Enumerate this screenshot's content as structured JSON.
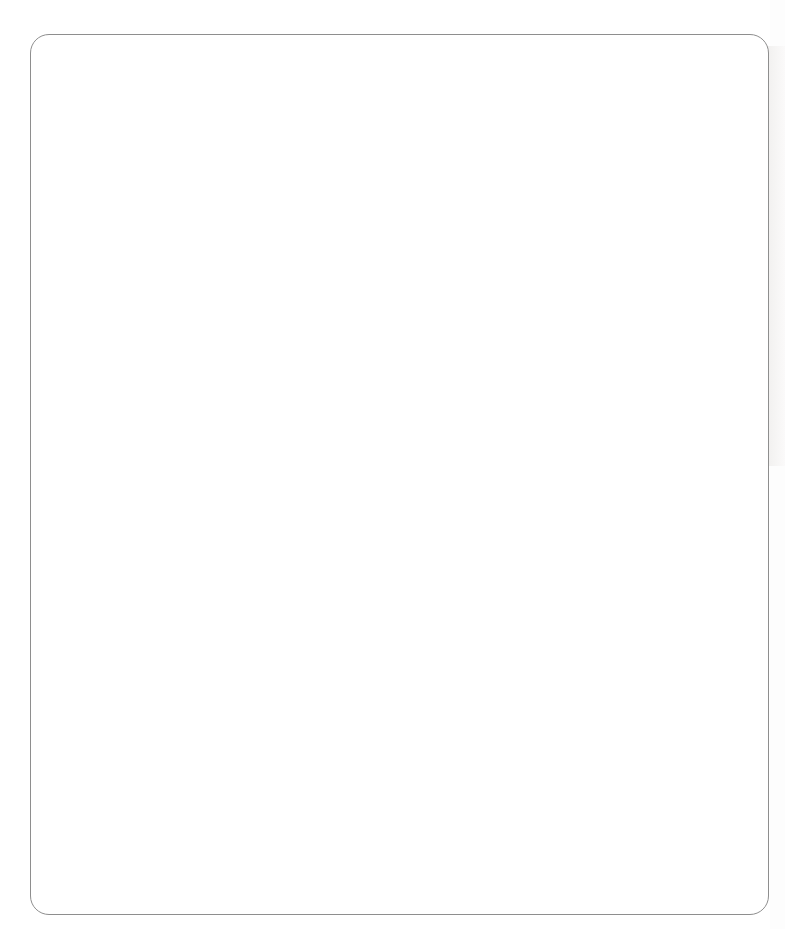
{
  "header": {
    "col_type": "Type of abuse",
    "col_percent": "Percent",
    "col_chart": "Dissociative experiences"
  },
  "groups": [
    {
      "title": "Emotional abuse",
      "rows": [
        {
          "label": "No emotional abuse",
          "percent": "74%"
        },
        {
          "label": "Low",
          "percent": "15%"
        },
        {
          "label": "High",
          "percent": "11%"
        }
      ]
    },
    {
      "title": "Physical abuse",
      "rows": [
        {
          "label": "No physical abuse",
          "percent": "72%"
        },
        {
          "label": "Low abuse",
          "percent": "12%"
        },
        {
          "label": "Moderate abuse",
          "percent": "6%"
        },
        {
          "label": "High abuse",
          "percent": "11%"
        }
      ]
    },
    {
      "title": "Sexual abuse",
      "rows": [
        {
          "label": "No abuse",
          "percent": "93%"
        },
        {
          "label": "Some abuse",
          "percent": "7%"
        }
      ]
    }
  ],
  "axis": {
    "ticks": [
      0,
      0.5,
      1,
      1.5,
      2,
      2.5
    ],
    "tick_labels": [
      "0",
      "0.5",
      "1",
      "1.5",
      "2",
      "2.5"
    ],
    "min": 0,
    "max": 2.5
  },
  "colors": {
    "bar_dark": "#575757",
    "bar_darkest": "#4a4a4a",
    "bar_medium": "#6e6e6e",
    "bar_light": "#8e8e8e",
    "frame": "#1d1d1d",
    "card_border": "#8e8e8e",
    "text": "#242424"
  },
  "chart_data": [
    {
      "type": "bar",
      "orientation": "horizontal",
      "title": "Dissociative experiences",
      "group": "Emotional abuse",
      "categories": [
        "No emotional abuse",
        "Low",
        "High"
      ],
      "values": [
        0.75,
        1.19,
        1.76
      ],
      "bar_colors": [
        "#575757",
        "#6e6e6e",
        "#4a4a4a"
      ],
      "xlabel": "",
      "ylabel": "",
      "xlim": [
        0,
        2.5
      ],
      "xticks": [
        0,
        0.5,
        1,
        1.5,
        2,
        2.5
      ],
      "grid": false,
      "legend": "none"
    },
    {
      "type": "bar",
      "orientation": "horizontal",
      "title": "Dissociative experiences",
      "group": "Physical abuse",
      "categories": [
        "No physical abuse",
        "Low abuse",
        "Moderate abuse",
        "High abuse"
      ],
      "values": [
        0.72,
        1.19,
        1.4,
        1.82
      ],
      "bar_colors": [
        "#575757",
        "#6e6e6e",
        "#4a4a4a",
        "#8e8e8e"
      ],
      "xlabel": "",
      "ylabel": "",
      "xlim": [
        0,
        2.5
      ],
      "xticks": [
        0,
        0.5,
        1,
        1.5,
        2,
        2.5
      ],
      "grid": false,
      "legend": "none"
    },
    {
      "type": "bar",
      "orientation": "horizontal",
      "title": "Dissociative experiences",
      "group": "Sexual abuse",
      "categories": [
        "No abuse",
        "Some abuse"
      ],
      "values": [
        0.85,
        2.2
      ],
      "bar_colors": [
        "#575757",
        "#6e6e6e"
      ],
      "xlabel": "",
      "ylabel": "",
      "xlim": [
        0,
        2.5
      ],
      "xticks": [
        0,
        0.5,
        1,
        1.5,
        2,
        2.5
      ],
      "grid": false,
      "legend": "none"
    }
  ]
}
